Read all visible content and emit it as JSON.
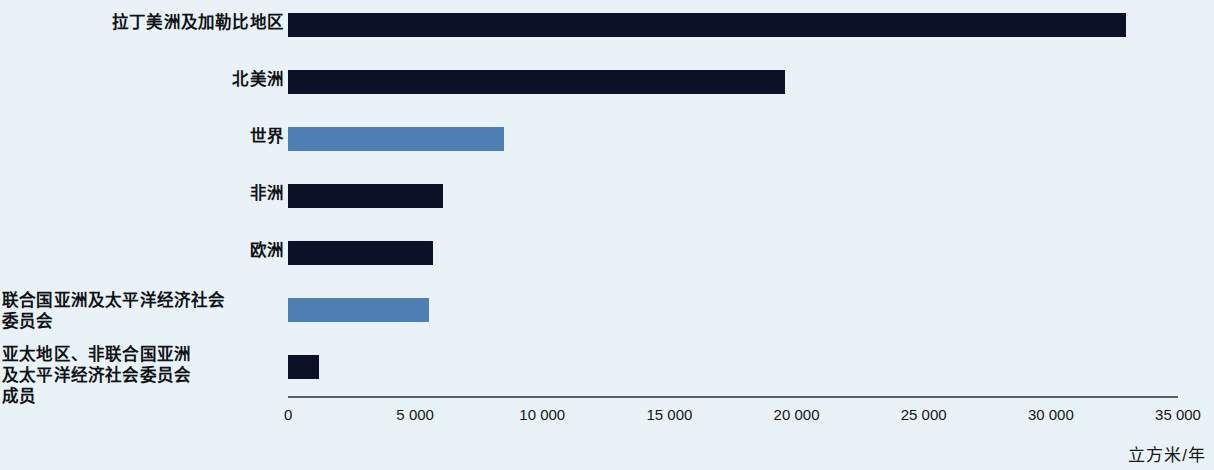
{
  "chart_data": {
    "type": "bar",
    "orientation": "horizontal",
    "title": "",
    "subtitle": "",
    "xlabel": "立方米/年",
    "ylabel": "",
    "xlim": [
      0,
      35000
    ],
    "grid": false,
    "legend": null,
    "categories": [
      "拉丁美洲及加勒比地区",
      "北美洲",
      "世界",
      "非洲",
      "欧洲",
      "联合国亚洲及太平洋经济社会\n委员会",
      "亚太地区、非联合国亚洲\n及太平洋经济社会委员会\n成员"
    ],
    "values": [
      32960,
      19550,
      8500,
      6100,
      5700,
      5550,
      1200
    ],
    "bar_colors": [
      "#0d1128",
      "#0d1128",
      "#4e80b4",
      "#0d1128",
      "#0d1128",
      "#4e80b4",
      "#0d1128"
    ],
    "xticks": [
      0,
      5000,
      10000,
      15000,
      20000,
      25000,
      30000,
      35000
    ],
    "xtick_labels": [
      "0",
      "5 000",
      "10 000",
      "15 000",
      "20 000",
      "25 000",
      "30 000",
      "35 000"
    ]
  },
  "colors": {
    "background": "#e9f2f6",
    "bar_dark": "#0d1128",
    "bar_blue": "#4e80b4",
    "axis": "#5c6166",
    "text": "#14171b"
  }
}
